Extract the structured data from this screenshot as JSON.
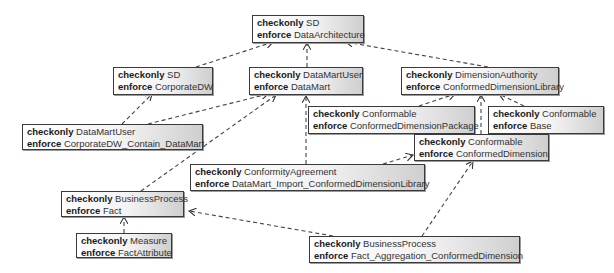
{
  "diagram": {
    "keywords": {
      "checkonly": "checkonly",
      "enforce": "enforce"
    },
    "nodes": [
      {
        "id": "sd_dataarch",
        "checkonly": "SD",
        "enforce": "DataArchitecture"
      },
      {
        "id": "sd_corpdw",
        "checkonly": "SD",
        "enforce": "CorporateDW"
      },
      {
        "id": "dmu_datamart",
        "checkonly": "DataMartUser",
        "enforce": "DataMart"
      },
      {
        "id": "da_cdl",
        "checkonly": "DimensionAuthority",
        "enforce": "ConformedDimensionLibrary"
      },
      {
        "id": "dmu_contain",
        "checkonly": "DataMartUser",
        "enforce": "CorporateDW_Contain_DataMart"
      },
      {
        "id": "conf_pkg",
        "checkonly": "Conformable",
        "enforce": "ConformedDimensionPackage"
      },
      {
        "id": "conf_base",
        "checkonly": "Conformable",
        "enforce": "Base"
      },
      {
        "id": "conf_cd",
        "checkonly": "Conformable",
        "enforce": "ConformedDimension"
      },
      {
        "id": "ca_import",
        "checkonly": "ConformityAgreement",
        "enforce": "DataMart_Import_ConformedDimensionLibrary"
      },
      {
        "id": "bp_fact",
        "checkonly": "BusinessProcess",
        "enforce": "Fact"
      },
      {
        "id": "m_factattr",
        "checkonly": "Measure",
        "enforce": "FactAttribute"
      },
      {
        "id": "bp_agg",
        "checkonly": "BusinessProcess",
        "enforce": "Fact_Aggregation_ConformedDimension"
      }
    ],
    "edges": [
      {
        "from": "sd_corpdw",
        "to": "sd_dataarch",
        "style": "dashed-arrow"
      },
      {
        "from": "dmu_datamart",
        "to": "sd_dataarch",
        "style": "dashed-arrow"
      },
      {
        "from": "da_cdl",
        "to": "sd_dataarch",
        "style": "dashed-arrow"
      },
      {
        "from": "dmu_contain",
        "to": "sd_corpdw",
        "style": "dashed-arrow"
      },
      {
        "from": "dmu_contain",
        "to": "dmu_datamart",
        "style": "dashed-arrow"
      },
      {
        "from": "bp_fact",
        "to": "dmu_datamart",
        "style": "dashed-arrow"
      },
      {
        "from": "ca_import",
        "to": "dmu_datamart",
        "style": "dashed-arrow"
      },
      {
        "from": "conf_pkg",
        "to": "da_cdl",
        "style": "dashed-arrow"
      },
      {
        "from": "conf_base",
        "to": "da_cdl",
        "style": "dashed-arrow"
      },
      {
        "from": "conf_cd",
        "to": "da_cdl",
        "style": "dashed-arrow"
      },
      {
        "from": "ca_import",
        "to": "conf_cd",
        "style": "dashed-arrow"
      },
      {
        "from": "bp_agg",
        "to": "conf_cd",
        "style": "dashed-arrow"
      },
      {
        "from": "bp_agg",
        "to": "bp_fact",
        "style": "dashed-arrow"
      },
      {
        "from": "m_factattr",
        "to": "bp_fact",
        "style": "dashed-arrow"
      }
    ]
  }
}
